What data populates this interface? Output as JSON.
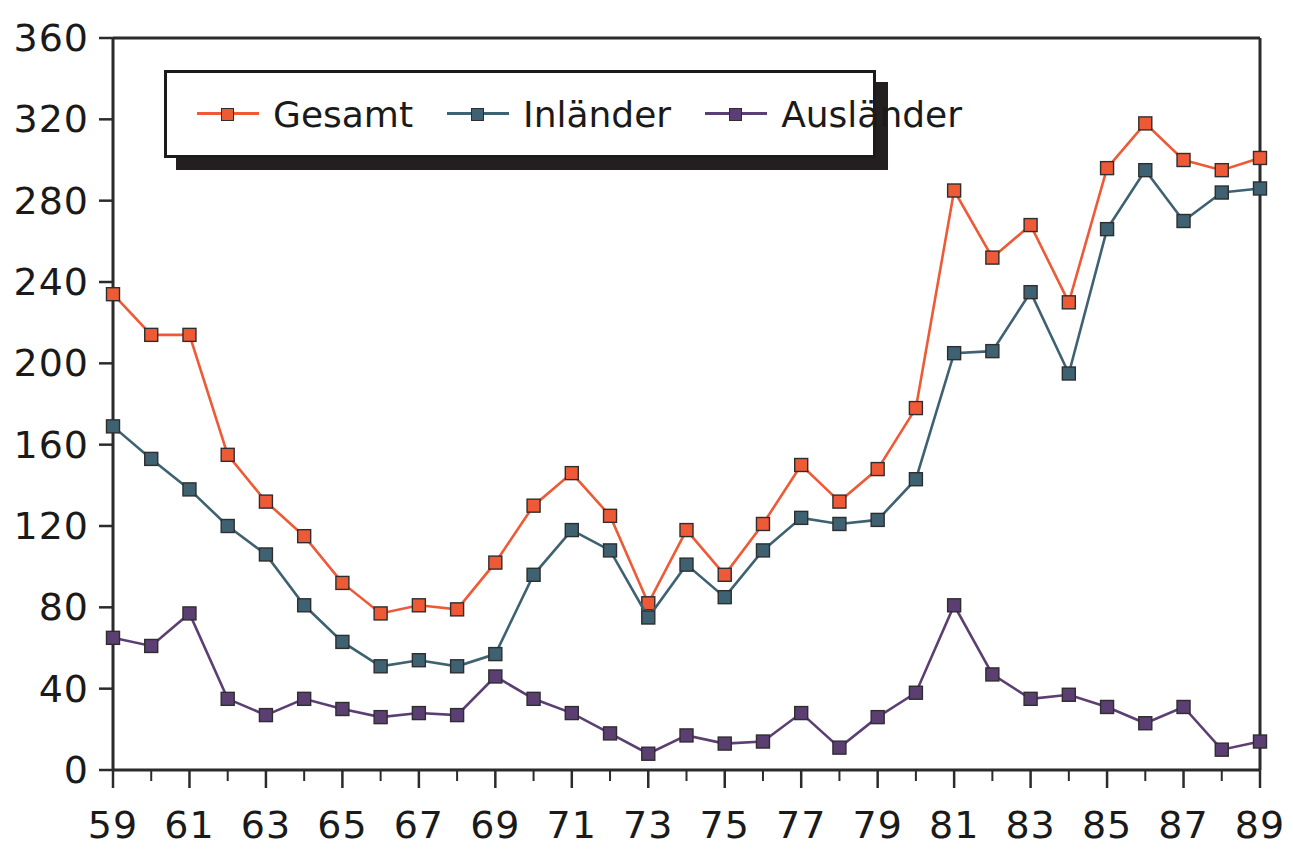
{
  "chart_data": {
    "type": "line",
    "title": "",
    "subtitle": "",
    "xlabel": "",
    "ylabel": "",
    "grid": false,
    "legend_position": "top-left-inside",
    "xlim": [
      59,
      89
    ],
    "ylim": [
      0,
      360
    ],
    "ytick_step": 40,
    "yticks": [
      0,
      40,
      80,
      120,
      160,
      200,
      240,
      280,
      320,
      360
    ],
    "ytick_labels": [
      "0",
      "40",
      "80",
      "120",
      "160",
      "200",
      "240",
      "280",
      "320",
      "360"
    ],
    "x": [
      59,
      60,
      61,
      62,
      63,
      64,
      65,
      66,
      67,
      68,
      69,
      70,
      71,
      72,
      73,
      74,
      75,
      76,
      77,
      78,
      79,
      80,
      81,
      82,
      83,
      84,
      85,
      86,
      87,
      88,
      89
    ],
    "xtick_labels_major": [
      "59",
      "61",
      "63",
      "65",
      "67",
      "69",
      "71",
      "73",
      "75",
      "77",
      "79",
      "81",
      "83",
      "85",
      "87",
      "89"
    ],
    "xticks_major": [
      59,
      61,
      63,
      65,
      67,
      69,
      71,
      73,
      75,
      77,
      79,
      81,
      83,
      85,
      87,
      89
    ],
    "series": [
      {
        "name": "Gesamt",
        "color": "#EE5A36",
        "marker": "square",
        "values": [
          234,
          214,
          214,
          155,
          132,
          115,
          92,
          77,
          81,
          79,
          102,
          130,
          146,
          125,
          82,
          118,
          96,
          121,
          150,
          132,
          148,
          178,
          285,
          252,
          268,
          230,
          296,
          318,
          300,
          295,
          301
        ]
      },
      {
        "name": "Inländer",
        "color": "#3E6272",
        "marker": "square",
        "values": [
          169,
          153,
          138,
          120,
          106,
          81,
          63,
          51,
          54,
          51,
          57,
          96,
          118,
          108,
          75,
          101,
          85,
          108,
          124,
          121,
          123,
          143,
          205,
          206,
          235,
          195,
          266,
          295,
          270,
          284,
          286
        ]
      },
      {
        "name": "Ausländer",
        "color": "#5B3F73",
        "marker": "square",
        "values": [
          65,
          61,
          77,
          35,
          27,
          35,
          30,
          26,
          28,
          27,
          46,
          35,
          28,
          18,
          8,
          17,
          13,
          14,
          28,
          11,
          26,
          38,
          81,
          47,
          35,
          37,
          31,
          23,
          31,
          10,
          14
        ]
      }
    ]
  },
  "legend": {
    "entries": [
      {
        "label": "Gesamt",
        "color": "#EE5A36"
      },
      {
        "label": "Inländer",
        "color": "#3E6272"
      },
      {
        "label": "Ausländer",
        "color": "#5B3F73"
      }
    ]
  }
}
